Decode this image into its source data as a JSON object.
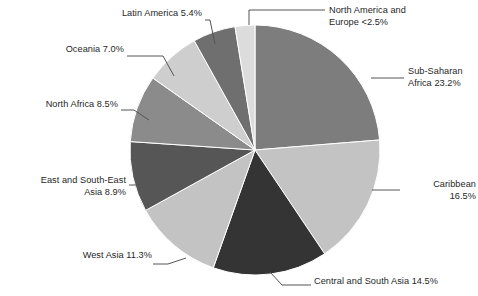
{
  "chart_data": {
    "type": "pie",
    "title": "",
    "subtitle": "",
    "xlabel": "",
    "ylabel": "",
    "legend_position": "none",
    "grid": false,
    "labels_position": "outside-with-leader-lines",
    "start_angle_deg": 0,
    "direction": "clockwise",
    "categories": [
      "Sub-Saharan Africa",
      "Caribbean",
      "Central and South Asia",
      "West Asia",
      "East and South-East Asia",
      "North Africa",
      "Oceania",
      "Latin America",
      "North America and Europe"
    ],
    "values": [
      23.2,
      16.5,
      14.5,
      11.3,
      8.9,
      8.5,
      7.0,
      5.4,
      2.5
    ],
    "slices": [
      {
        "name": "Sub-Saharan Africa",
        "value": 23.2,
        "value_text": "23.2%",
        "label": "Sub-Saharan\nAfrica 23.2%",
        "color": "#7d7d7d"
      },
      {
        "name": "Caribbean",
        "value": 16.5,
        "value_text": "16.5%",
        "label": "Caribbean\n16.5%",
        "color": "#c3c3c3"
      },
      {
        "name": "Central and South Asia",
        "value": 14.5,
        "value_text": "14.5%",
        "label": "Central and South Asia 14.5%",
        "color": "#343434"
      },
      {
        "name": "West Asia",
        "value": 11.3,
        "value_text": "11.3%",
        "label": "West Asia 11.3%",
        "color": "#c3c3c3"
      },
      {
        "name": "East and South-East Asia",
        "value": 8.9,
        "value_text": "8.9%",
        "label": "East and South-East\nAsia 8.9%",
        "color": "#565656"
      },
      {
        "name": "North Africa",
        "value": 8.5,
        "value_text": "8.5%",
        "label": "North Africa 8.5%",
        "color": "#8b8b8b"
      },
      {
        "name": "Oceania",
        "value": 7.0,
        "value_text": "7.0%",
        "label": "Oceania 7.0%",
        "color": "#cecece"
      },
      {
        "name": "Latin America",
        "value": 5.4,
        "value_text": "5.4%",
        "label": "Latin America 5.4%",
        "color": "#6f6f6f"
      },
      {
        "name": "North America and Europe",
        "value": 2.5,
        "value_text": "<2.5%",
        "label": "North America and\nEurope <2.5%",
        "color": "#dcdcdc"
      }
    ],
    "colors": {
      "background": "#ffffff",
      "text": "#1f1f1f",
      "leader_line": "#555555"
    }
  }
}
